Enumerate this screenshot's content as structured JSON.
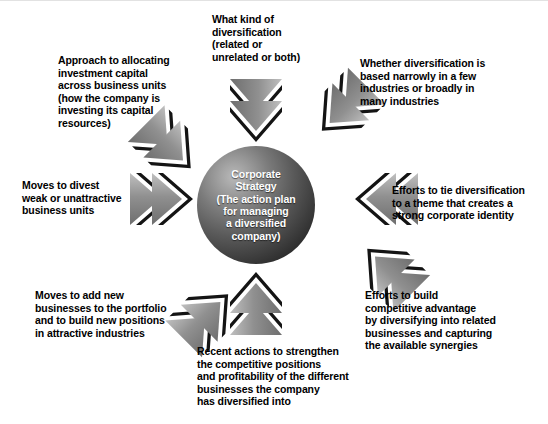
{
  "diagram": {
    "center": {
      "name": "corporate-strategy",
      "text": "Corporate\nStrategy\n(The action plan\nfor managing\na diversified\ncompany)"
    },
    "colors": {
      "background": "#ffffff",
      "text": "#000000",
      "center_text": "#ffffff",
      "arrow_light": "#a6a6a6",
      "arrow_mid": "#7d7d7d",
      "arrow_dark": "#1c1c1c",
      "border": "#e2e2e2"
    },
    "labels": [
      {
        "name": "label-kind-of-diversification",
        "position": "top",
        "text": "What kind of\ndiversification\n(related or\nunrelated or both)"
      },
      {
        "name": "label-investment-capital-allocation",
        "position": "top-left",
        "text": "Approach to allocating\ninvestment capital\nacross business units\n(how the company is\ninvesting its capital\nresources)"
      },
      {
        "name": "label-breadth-of-diversification",
        "position": "top-right",
        "text": "Whether diversification is\nbased narrowly in a few\nindustries or broadly in\nmany industries"
      },
      {
        "name": "label-divest-weak-units",
        "position": "left",
        "text": "Moves to divest\nweak or unattractive\nbusiness units"
      },
      {
        "name": "label-tie-diversification-to-theme",
        "position": "right",
        "text": "Efforts to tie diversification\nto a theme that creates a\nstrong corporate identity"
      },
      {
        "name": "label-add-new-businesses",
        "position": "bottom-left",
        "text": "Moves to add new\nbusinesses to the portfolio\nand to build new positions\nin attractive industries"
      },
      {
        "name": "label-build-competitive-advantage",
        "position": "bottom-right",
        "text": "Efforts to build\ncompetitive advantage\nby diversifying into related\nbusinesses and capturing\nthe available synergies"
      },
      {
        "name": "label-strengthen-competitive-positions",
        "position": "bottom",
        "text": "Recent actions to strengthen\nthe competitive positions\nand profitability of the different\nbusinesses the company\nhas diversified into"
      }
    ],
    "arrows": [
      {
        "name": "arrow-from-top",
        "direction": "down"
      },
      {
        "name": "arrow-from-top-left",
        "direction": "down-right"
      },
      {
        "name": "arrow-from-top-right",
        "direction": "down-left"
      },
      {
        "name": "arrow-from-left",
        "direction": "right"
      },
      {
        "name": "arrow-from-right",
        "direction": "left"
      },
      {
        "name": "arrow-from-bottom-left",
        "direction": "up-right"
      },
      {
        "name": "arrow-from-bottom-right",
        "direction": "up-left"
      },
      {
        "name": "arrow-from-bottom",
        "direction": "up"
      }
    ]
  }
}
